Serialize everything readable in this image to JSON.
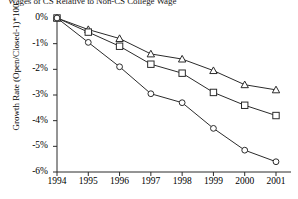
{
  "chart_data": {
    "type": "line",
    "title": "Wages of CS Relative to Non-CS College Wage",
    "xlabel": "",
    "ylabel": "Growth Rate (Open/Closed-1)*100",
    "x": [
      1994,
      1995,
      1996,
      1997,
      1998,
      1999,
      2000,
      2001
    ],
    "categories": [
      "1994",
      "1995",
      "1996",
      "1997",
      "1998",
      "1999",
      "2000",
      "2001"
    ],
    "ylim": [
      -6,
      0
    ],
    "xlim": [
      1994,
      2001
    ],
    "ytick_labels": [
      "0%",
      "-1%",
      "-2%",
      "-3%",
      "-4%",
      "-5%",
      "-6%"
    ],
    "ytick_values": [
      0,
      -1,
      -2,
      -3,
      -4,
      -5,
      -6
    ],
    "grid": false,
    "legend": "none",
    "series": [
      {
        "name": "triangle-series",
        "marker": "triangle",
        "values": [
          0,
          -0.45,
          -0.8,
          -1.4,
          -1.6,
          -2.05,
          -2.6,
          -2.8
        ]
      },
      {
        "name": "square-series",
        "marker": "square",
        "values": [
          0,
          -0.55,
          -1.1,
          -1.8,
          -2.15,
          -2.9,
          -3.4,
          -3.8
        ]
      },
      {
        "name": "circle-series",
        "marker": "circle",
        "values": [
          0,
          -0.95,
          -1.9,
          -2.95,
          -3.3,
          -4.3,
          -5.15,
          -5.6
        ]
      }
    ]
  },
  "colors": {
    "line": "#2b2b2b",
    "marker_fill": "#ffffff",
    "axis": "#2b2b2b",
    "background": "#ffffff"
  }
}
